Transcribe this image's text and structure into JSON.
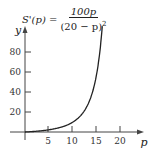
{
  "chart_data": {
    "type": "line",
    "formula": {
      "lhs": "S'(p) =",
      "numerator": "100p",
      "denominator": "(20 − p)",
      "exponent": "2"
    },
    "xlabel": "p",
    "ylabel": "y",
    "xlim": [
      0,
      22
    ],
    "ylim": [
      0,
      90
    ],
    "x_ticks": [
      5,
      10,
      15,
      20
    ],
    "y_ticks": [
      20,
      40,
      60,
      80
    ],
    "grid": false,
    "legend": null,
    "series": [
      {
        "name": "S'(p)",
        "x": [
          0,
          2,
          4,
          6,
          8,
          10,
          11,
          12,
          13,
          14,
          15,
          15.5,
          16,
          16.3
        ],
        "y": [
          0,
          0.62,
          1.56,
          3.06,
          5.56,
          10,
          13.58,
          18.75,
          26.53,
          38.89,
          60,
          76.54,
          100,
          119.07
        ]
      }
    ]
  },
  "labels": {
    "x_axis": "p",
    "y_axis": "y",
    "x_ticks": [
      "5",
      "10",
      "15",
      "20"
    ],
    "y_ticks": [
      "20",
      "40",
      "60",
      "80"
    ]
  }
}
